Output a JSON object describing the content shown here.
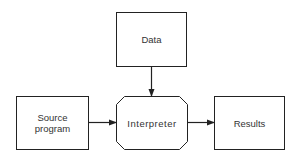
{
  "diagram": {
    "nodes": {
      "data": {
        "label": "Data",
        "shape": "rectangle"
      },
      "source": {
        "label_line1": "Source",
        "label_line2": "program",
        "shape": "rectangle"
      },
      "interpreter": {
        "label": "Interpreter",
        "shape": "octagon"
      },
      "results": {
        "label": "Results",
        "shape": "rectangle"
      }
    },
    "edges": [
      {
        "from": "Data",
        "to": "Interpreter"
      },
      {
        "from": "Source program",
        "to": "Interpreter"
      },
      {
        "from": "Interpreter",
        "to": "Results"
      }
    ],
    "colors": {
      "stroke": "#222222",
      "background": "#ffffff",
      "text": "#333333"
    }
  }
}
